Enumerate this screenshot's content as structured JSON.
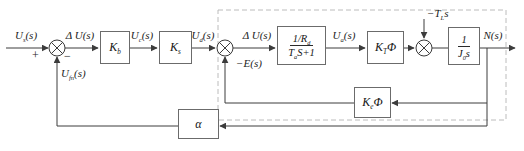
{
  "figure": {
    "type": "control-system-block-diagram",
    "colors": {
      "line": "#3c3c3c",
      "block_border": "#6b6b6b",
      "dashed_boundary": "#bcbcbc",
      "text": "#1c1c1c",
      "background": "#ffffff"
    },
    "signals": {
      "input": {
        "pre": "U",
        "sub": "s",
        "post": "(s)"
      },
      "plus_sign": {
        "pre": "+"
      },
      "minus_sign": {
        "pre": "−"
      },
      "speed_feedback": {
        "pre": "U",
        "sub": "fn",
        "post": "(s)"
      },
      "error1": {
        "pre": "Δ U",
        "post": "(s)"
      },
      "control": {
        "pre": "U",
        "sub": "c",
        "post": "(s)"
      },
      "rectified": {
        "pre": "U",
        "sub": "d",
        "post": "(s)"
      },
      "error2": {
        "pre": "Δ U",
        "post": "(s)"
      },
      "back_emf": {
        "pre": "−E",
        "post": "(s)"
      },
      "armature": {
        "pre": "U",
        "sub": "a",
        "post": "(s)"
      },
      "load_torque": {
        "pre": "−T",
        "sub": "L",
        "post": "s"
      },
      "output": {
        "pre": "N",
        "post": "(s)"
      }
    },
    "blocks": {
      "amplifier": {
        "pre": "K",
        "sub": "b"
      },
      "rectifier": {
        "pre": "K",
        "sub": "s"
      },
      "armature_circuit": {
        "num_pre": "1/R",
        "num_sub": "d",
        "den_pre": "T",
        "den_sub": "a",
        "den_post": "S+1"
      },
      "torque_constant": {
        "pre": "K",
        "sub": "T",
        "post": "Φ"
      },
      "inertia": {
        "num_pre": "1",
        "den_pre": "J",
        "den_sub": "0",
        "den_post": "s"
      },
      "emf_constant": {
        "pre": "K",
        "sub": "e",
        "post": "Φ"
      },
      "feedback_gain": {
        "pre": "α"
      }
    }
  }
}
